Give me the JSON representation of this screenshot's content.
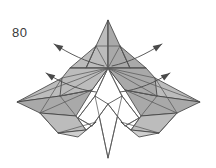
{
  "figure": {
    "step_number": "80",
    "kind": "origami-folding-diagram",
    "colors": {
      "paper_shaded": "#bcbcbc",
      "paper_shaded_dark": "#a9a9a9",
      "paper_shaded_light": "#cfcfcf",
      "paper_white": "#ffffff",
      "outline": "#3c3c3c",
      "crease": "#5a5a5a",
      "arrow": "#4a4a4a",
      "label": "#3a3a3a",
      "background": "#ffffff"
    },
    "canvas": {
      "width": 216,
      "height": 168
    },
    "shapes": [
      {
        "name": "left-wing-upper",
        "fill": "paper_shaded",
        "points": "17,102 62,78 108,68 92,90 60,96"
      },
      {
        "name": "left-wing-lower",
        "fill": "paper_shaded_dark",
        "points": "17,102 60,96 92,90 76,116 40,113"
      },
      {
        "name": "left-wing-tip-flap",
        "fill": "paper_shaded",
        "points": "40,113 76,116 86,130 58,133"
      },
      {
        "name": "left-inner-flap",
        "fill": "paper_shaded_light",
        "points": "58,133 86,130 96,122 78,137"
      },
      {
        "name": "right-wing-upper",
        "fill": "paper_shaded",
        "points": "200,102 155,78 108,68 125,90 157,96"
      },
      {
        "name": "right-wing-lower",
        "fill": "paper_shaded_dark",
        "points": "200,102 157,96 125,90 141,116 177,113"
      },
      {
        "name": "right-wing-tip-flap",
        "fill": "paper_shaded",
        "points": "177,113 141,116 131,130 159,133"
      },
      {
        "name": "right-inner-flap",
        "fill": "paper_shaded_light",
        "points": "159,133 131,130 121,122 139,137"
      },
      {
        "name": "head-left-panel",
        "fill": "paper_shaded",
        "points": "108,20 96,46 86,68 108,68"
      },
      {
        "name": "head-right-panel",
        "fill": "paper_shaded_dark",
        "points": "108,20 120,46 130,68 108,68"
      },
      {
        "name": "head-left-outer",
        "fill": "paper_shaded",
        "points": "96,46 70,68 86,68"
      },
      {
        "name": "head-right-outer",
        "fill": "paper_shaded_dark",
        "points": "120,46 146,68 130,68"
      },
      {
        "name": "shoulder-left",
        "fill": "paper_shaded",
        "points": "70,68 86,68 108,68 92,90 60,96 62,78"
      },
      {
        "name": "shoulder-right",
        "fill": "paper_shaded_dark",
        "points": "146,68 130,68 108,68 125,90 157,96 155,78"
      },
      {
        "name": "center-body-white",
        "fill": "paper_white",
        "points": "108,68 95,96 108,158 122,96"
      },
      {
        "name": "center-left-white",
        "fill": "paper_white",
        "points": "95,96 78,118 92,126 108,104"
      },
      {
        "name": "center-right-white",
        "fill": "paper_white",
        "points": "122,96 139,118 125,126 108,104"
      }
    ],
    "creases": [
      "108,20 108,68",
      "96,46 120,46",
      "96,46 108,68",
      "120,46 108,68",
      "96,46 86,68",
      "120,46 130,68",
      "70,68 146,68",
      "62,78 108,68",
      "155,78 108,68",
      "60,96 108,68",
      "157,96 108,68",
      "17,102 108,68",
      "200,102 108,68",
      "92,90 60,96",
      "125,90 157,96",
      "40,113 92,90",
      "177,113 125,90",
      "58,133 96,122",
      "159,133 121,122",
      "108,68 95,96",
      "108,68 122,96",
      "95,96 108,158",
      "122,96 108,158",
      "95,96 78,118",
      "122,96 139,118",
      "78,118 92,126",
      "139,118 125,126",
      "92,126 108,104",
      "125,126 108,104",
      "40,113 58,133",
      "177,113 159,133",
      "76,116 86,130",
      "141,116 131,130",
      "60,96 76,116",
      "157,96 141,116",
      "62,78 40,113",
      "155,78 177,113"
    ],
    "arrows": [
      {
        "name": "arrow-upper-left",
        "direction": "up-left",
        "path": "M 104,66 C 86,62 70,54 54,44",
        "tip": "54,44",
        "angle": -148
      },
      {
        "name": "arrow-lower-left",
        "direction": "up-left",
        "path": "M 96,92 C 78,90 60,82 46,73",
        "tip": "46,73",
        "angle": -147
      },
      {
        "name": "arrow-upper-right",
        "direction": "up-right",
        "path": "M 112,66 C 130,62 146,54 162,44",
        "tip": "162,44",
        "angle": -32
      },
      {
        "name": "arrow-lower-right",
        "direction": "up-right",
        "path": "M 120,92 C 138,90 156,82 170,73",
        "tip": "170,73",
        "angle": -33
      }
    ]
  }
}
